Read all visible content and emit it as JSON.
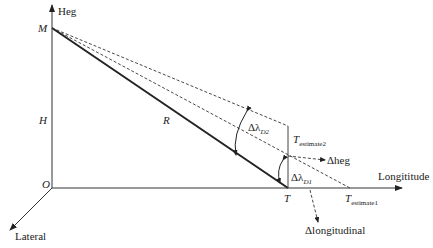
{
  "diagram": {
    "axes": {
      "vertical": "Heg",
      "horizontal": "Longititude",
      "lateral": "Lateral"
    },
    "points": {
      "M": "M",
      "H": "H",
      "O": "O",
      "T": "T",
      "R": "R"
    },
    "estimates": {
      "t_estimate1_main": "T",
      "t_estimate1_sub": "estimate1",
      "t_estimate2_main": "T",
      "t_estimate2_sub": "estimate2"
    },
    "angles": {
      "d2_main": "Δλ",
      "d2_sub": "D2",
      "d1_main": "Δλ",
      "d1_sub": "D1"
    },
    "deltas": {
      "heg": "Δheg",
      "longitudinal": "Δlongitudinal"
    }
  }
}
